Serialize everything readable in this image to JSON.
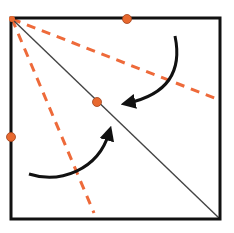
{
  "diagram": {
    "title": "",
    "colors": {
      "square_stroke": "#111111",
      "diagonal_stroke": "#444444",
      "fold_line": "#ee6a3a",
      "point_fill": "#e8692f",
      "point_stroke": "#a0401a",
      "arrow": "#111111",
      "background": "#ffffff"
    },
    "elements": {
      "square": "square outline",
      "diagonal": "diagonal from top-left to bottom-right corner",
      "fold_lines": [
        "dashed fold line toward right edge",
        "dashed fold line toward bottom edge"
      ],
      "points": [
        "point on top edge",
        "point on left edge",
        "image point on diagonal"
      ],
      "arrows": [
        "fold arrow from top-right region toward diagonal",
        "fold arrow from bottom-left region toward diagonal"
      ]
    }
  }
}
